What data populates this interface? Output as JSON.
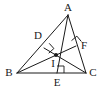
{
  "figure": {
    "type": "geometry-diagram",
    "width": 103,
    "height": 89,
    "background_color": "#ffffff",
    "stroke_color": "#1a1a1a",
    "label_color": "#1a1a1a"
  },
  "points": [
    {
      "name": "A",
      "label": "A",
      "x": 68,
      "y": 15,
      "label_x": 68,
      "label_y": 7,
      "marker": "none"
    },
    {
      "name": "B",
      "label": "B",
      "x": 17,
      "y": 73,
      "label_x": 9,
      "label_y": 72,
      "marker": "none"
    },
    {
      "name": "C",
      "label": "C",
      "x": 86,
      "y": 73,
      "label_x": 93,
      "label_y": 72,
      "marker": "none"
    },
    {
      "name": "D",
      "label": "D",
      "x": 44,
      "y": 48,
      "label_x": 38,
      "label_y": 35,
      "marker": "none"
    },
    {
      "name": "E",
      "label": "E",
      "x": 57,
      "y": 73,
      "label_x": 57,
      "label_y": 82,
      "marker": "none"
    },
    {
      "name": "F",
      "label": "F",
      "x": 76,
      "y": 46,
      "label_x": 84,
      "label_y": 45,
      "marker": "none"
    },
    {
      "name": "I",
      "label": "I",
      "x": 56,
      "y": 55,
      "label_x": 53,
      "label_y": 63,
      "marker": "filled-dot"
    }
  ],
  "segments": [
    {
      "name": "side-AB",
      "from": "A",
      "to": "B"
    },
    {
      "name": "side-AC",
      "from": "A",
      "to": "C"
    },
    {
      "name": "side-BC",
      "from": "B",
      "to": "C"
    },
    {
      "name": "altitude-AE",
      "from": "A",
      "to": "E"
    },
    {
      "name": "altitude-BF",
      "from": "B",
      "to": "F"
    },
    {
      "name": "altitude-CD",
      "from": "C",
      "to": "D"
    }
  ],
  "right_angles": [
    {
      "name": "right-angle-at-D",
      "at": "D",
      "size": 7,
      "rotation_deg": 48
    },
    {
      "name": "right-angle-at-E",
      "at": "E",
      "size": 7,
      "rotation_deg": 0
    },
    {
      "name": "right-angle-at-F",
      "at": "F",
      "size": 7,
      "rotation_deg": -40
    }
  ]
}
